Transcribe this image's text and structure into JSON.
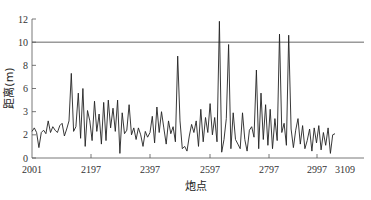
{
  "chart_data": {
    "type": "line",
    "title": "",
    "xlabel": "炮点",
    "ylabel": "距离(m)",
    "xlim": [
      2001,
      3109
    ],
    "ylim": [
      0,
      12
    ],
    "x_ticks": [
      2001,
      2197,
      2397,
      2597,
      2797,
      2997,
      3109
    ],
    "y_ticks": [
      {
        "value": 0,
        "label": "0"
      },
      {
        "value": 2,
        "label": "2"
      },
      {
        "value": 4,
        "label": "3"
      },
      {
        "value": 6,
        "label": "6"
      },
      {
        "value": 8,
        "label": "8"
      },
      {
        "value": 10,
        "label": "10"
      },
      {
        "value": 12,
        "label": "12"
      }
    ],
    "grid": false,
    "reference_line": {
      "y": 10,
      "color": "#555555"
    },
    "line_color": "#222222",
    "series": [
      {
        "name": "距离",
        "x_start": 2001,
        "x_step": 10,
        "values": [
          2.3,
          2.6,
          2.2,
          0.9,
          2.2,
          2.4,
          2.1,
          3.2,
          2.2,
          2.7,
          2.4,
          2.2,
          2.8,
          3.0,
          1.9,
          2.5,
          3.2,
          7.3,
          2.3,
          2.7,
          5.6,
          1.7,
          6.0,
          1.0,
          4.1,
          3.2,
          1.5,
          4.9,
          2.3,
          3.8,
          1.2,
          4.8,
          1.5,
          5.0,
          2.6,
          4.3,
          2.3,
          5.0,
          0.4,
          3.9,
          2.1,
          2.4,
          4.6,
          2.0,
          2.6,
          1.6,
          2.6,
          2.0,
          1.0,
          2.3,
          1.8,
          2.2,
          3.6,
          1.3,
          4.4,
          2.2,
          4.0,
          2.6,
          1.2,
          3.2,
          2.1,
          2.7,
          1.4,
          8.8,
          3.2,
          0.8,
          1.0,
          0.6,
          1.9,
          2.9,
          2.2,
          3.2,
          1.0,
          4.2,
          1.4,
          3.5,
          2.2,
          4.7,
          2.0,
          3.5,
          1.4,
          11.8,
          0.5,
          1.6,
          3.4,
          9.8,
          0.8,
          3.9,
          1.6,
          1.2,
          0.8,
          3.9,
          1.6,
          0.6,
          2.4,
          2.7,
          1.8,
          7.6,
          0.8,
          5.6,
          1.6,
          4.6,
          1.1,
          4.2,
          0.8,
          3.4,
          1.5,
          10.7,
          2.2,
          3.0,
          1.1,
          10.6,
          2.5,
          0.9,
          2.4,
          3.4,
          1.2,
          2.8,
          0.8,
          1.5,
          2.5,
          0.6,
          2.6,
          1.3,
          2.8,
          0.7,
          2.2,
          1.1,
          2.6,
          0.4,
          2.0,
          2.1
        ]
      }
    ]
  }
}
